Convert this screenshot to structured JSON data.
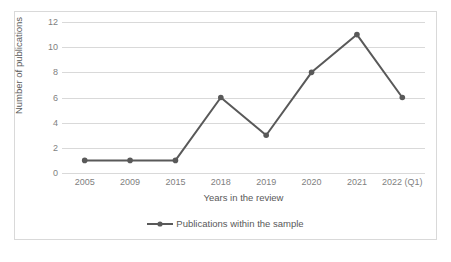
{
  "chart_data": {
    "type": "line",
    "title": "",
    "subtitle": "",
    "xlabel": "Years in the review",
    "ylabel": "Number of publications",
    "categories": [
      "2005",
      "2009",
      "2015",
      "2018",
      "2019",
      "2020",
      "2021",
      "2022 (Q1)"
    ],
    "series": [
      {
        "name": "Publications within the sample",
        "values": [
          1,
          1,
          1,
          6,
          3,
          8,
          11,
          6
        ]
      }
    ],
    "ylim": [
      0,
      12
    ],
    "y_ticks": [
      0,
      2,
      4,
      6,
      8,
      10,
      12
    ],
    "y_tick_labels": [
      "0",
      "2",
      "4",
      "6",
      "8",
      "10",
      "12"
    ],
    "grid": "horizontal",
    "legend_position": "bottom",
    "colors": {
      "series": "#595959",
      "gridline": "#d9d9d9",
      "border": "#d9d9d9",
      "axis_text": "#7f7f7f",
      "title_text": "#595959",
      "background": "#ffffff"
    },
    "marker": "circle",
    "line_width": 2
  },
  "legend": {
    "entry_label": "Publications within the sample"
  }
}
